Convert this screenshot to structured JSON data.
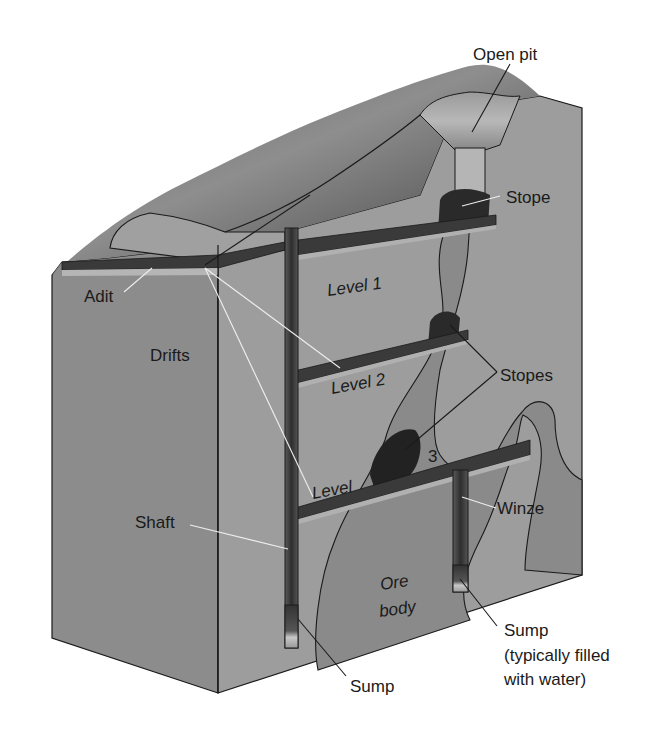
{
  "diagram": {
    "labels": {
      "open_pit": "Open pit",
      "stope": "Stope",
      "adit": "Adit",
      "level1": "Level 1",
      "drifts": "Drifts",
      "level2": "Level 2",
      "stopes": "Stopes",
      "level3_word": "Level",
      "level3_num": "3",
      "winze": "Winze",
      "shaft": "Shaft",
      "ore_line1": "Ore",
      "ore_line2": "body",
      "sump_left": "Sump",
      "sump_right_line1": "Sump",
      "sump_right_line2": "(typically filled",
      "sump_right_line3": "with water)"
    },
    "colors": {
      "rock_face_left": "#8c8c8c",
      "rock_face_right": "#9d9d9d",
      "surface_top": "#7a7a7a",
      "ore_body": "#8a8a8a",
      "tunnel_dark": "#3a3a3a",
      "tunnel_light": "#a8a8a8",
      "stope_dark": "#2a2a2a",
      "outline": "#1a1a1a",
      "background": "#ffffff"
    }
  }
}
